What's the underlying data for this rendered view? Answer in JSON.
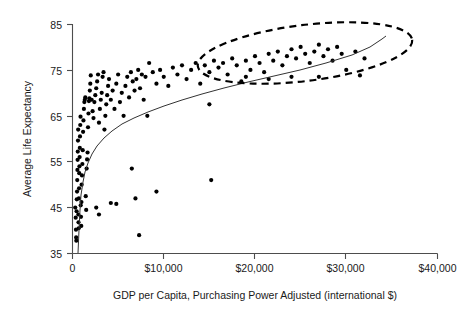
{
  "chart_data": {
    "type": "scatter",
    "title": "",
    "xlabel": "GDP per Capita, Purchasing Power Adjusted (international $)",
    "ylabel": "Average Life Expectancy",
    "xlim": [
      0,
      40000
    ],
    "ylim": [
      35,
      85
    ],
    "grid": false,
    "legend": null,
    "xticks": [
      0,
      10000,
      20000,
      30000,
      40000
    ],
    "xticklabels": [
      "0",
      "$10,000",
      "$20,000",
      "$30,000",
      "$40,000"
    ],
    "yticks": [
      35,
      45,
      55,
      65,
      75,
      85
    ],
    "yticklabels": [
      "35",
      "45",
      "55",
      "65",
      "75",
      "85"
    ],
    "series": [
      {
        "name": "Countries",
        "marker": "filled-circle",
        "color": "#000000",
        "points": [
          [
            300,
            45.0
          ],
          [
            350,
            42.8
          ],
          [
            380,
            40.2
          ],
          [
            400,
            38.5
          ],
          [
            420,
            37.8
          ],
          [
            450,
            44.2
          ],
          [
            470,
            46.8
          ],
          [
            500,
            48.5
          ],
          [
            520,
            51.0
          ],
          [
            540,
            53.2
          ],
          [
            560,
            55.4
          ],
          [
            580,
            57.2
          ],
          [
            600,
            59.6
          ],
          [
            620,
            62.0
          ],
          [
            640,
            43.5
          ],
          [
            660,
            41.8
          ],
          [
            680,
            40.5
          ],
          [
            700,
            47.0
          ],
          [
            720,
            49.2
          ],
          [
            740,
            52.5
          ],
          [
            760,
            54.0
          ],
          [
            780,
            56.0
          ],
          [
            800,
            58.0
          ],
          [
            820,
            60.5
          ],
          [
            850,
            63.0
          ],
          [
            880,
            64.8
          ],
          [
            900,
            45.5
          ],
          [
            930,
            43.0
          ],
          [
            960,
            41.0
          ],
          [
            980,
            46.2
          ],
          [
            1000,
            50.0
          ],
          [
            1040,
            52.0
          ],
          [
            1080,
            54.5
          ],
          [
            1120,
            57.5
          ],
          [
            1160,
            61.5
          ],
          [
            1200,
            64.0
          ],
          [
            1250,
            66.5
          ],
          [
            1300,
            68.0
          ],
          [
            1350,
            68.5
          ],
          [
            1400,
            69.0
          ],
          [
            1450,
            47.5
          ],
          [
            1500,
            44.5
          ],
          [
            1550,
            53.5
          ],
          [
            1600,
            55.5
          ],
          [
            1650,
            57.0
          ],
          [
            1700,
            62.5
          ],
          [
            1750,
            65.5
          ],
          [
            1800,
            68.2
          ],
          [
            1850,
            68.8
          ],
          [
            1900,
            70.5
          ],
          [
            1950,
            72.0
          ],
          [
            2000,
            73.8
          ],
          [
            2100,
            68.5
          ],
          [
            2200,
            66.0
          ],
          [
            2300,
            64.5
          ],
          [
            2400,
            68.0
          ],
          [
            2500,
            69.5
          ],
          [
            2600,
            71.0
          ],
          [
            2700,
            72.5
          ],
          [
            2800,
            74.0
          ],
          [
            2900,
            63.5
          ],
          [
            3000,
            66.5
          ],
          [
            3100,
            68.5
          ],
          [
            3200,
            70.0
          ],
          [
            3300,
            73.5
          ],
          [
            3400,
            74.5
          ],
          [
            3500,
            62.0
          ],
          [
            3600,
            65.0
          ],
          [
            3700,
            67.5
          ],
          [
            3800,
            69.5
          ],
          [
            3900,
            71.5
          ],
          [
            4000,
            73.0
          ],
          [
            4200,
            68.5
          ],
          [
            4400,
            70.5
          ],
          [
            4600,
            66.5
          ],
          [
            4800,
            72.0
          ],
          [
            5000,
            74.0
          ],
          [
            5200,
            68.0
          ],
          [
            5400,
            70.0
          ],
          [
            5600,
            65.0
          ],
          [
            5800,
            71.5
          ],
          [
            6000,
            73.5
          ],
          [
            6200,
            69.0
          ],
          [
            6400,
            74.5
          ],
          [
            6600,
            72.5
          ],
          [
            6800,
            70.5
          ],
          [
            7000,
            73.0
          ],
          [
            7200,
            75.0
          ],
          [
            7400,
            71.0
          ],
          [
            7600,
            74.0
          ],
          [
            7800,
            68.5
          ],
          [
            8000,
            73.5
          ],
          [
            8400,
            76.5
          ],
          [
            8800,
            74.5
          ],
          [
            9200,
            72.0
          ],
          [
            9600,
            75.0
          ],
          [
            10000,
            73.5
          ],
          [
            10500,
            71.5
          ],
          [
            11000,
            75.5
          ],
          [
            11500,
            74.0
          ],
          [
            12000,
            76.0
          ],
          [
            12500,
            73.0
          ],
          [
            13000,
            75.0
          ],
          [
            13500,
            76.5
          ],
          [
            14000,
            72.0
          ],
          [
            14500,
            76.0
          ],
          [
            15000,
            74.5
          ],
          [
            15500,
            77.0
          ],
          [
            16000,
            75.5
          ],
          [
            16500,
            76.5
          ],
          [
            17000,
            74.0
          ],
          [
            17500,
            77.5
          ],
          [
            18000,
            76.0
          ],
          [
            18500,
            72.5
          ],
          [
            19000,
            77.0
          ],
          [
            19500,
            75.0
          ],
          [
            20000,
            78.0
          ],
          [
            20500,
            76.5
          ],
          [
            21000,
            74.5
          ],
          [
            21500,
            78.5
          ],
          [
            22000,
            77.0
          ],
          [
            22500,
            79.0
          ],
          [
            23000,
            76.0
          ],
          [
            23500,
            78.0
          ],
          [
            24000,
            79.5
          ],
          [
            24500,
            77.5
          ],
          [
            25000,
            80.0
          ],
          [
            25500,
            78.5
          ],
          [
            26000,
            76.5
          ],
          [
            26500,
            79.0
          ],
          [
            27000,
            80.5
          ],
          [
            27500,
            78.0
          ],
          [
            28000,
            79.5
          ],
          [
            28500,
            77.0
          ],
          [
            29000,
            80.0
          ],
          [
            29500,
            78.5
          ],
          [
            30000,
            75.0
          ],
          [
            31000,
            79.0
          ],
          [
            32000,
            77.5
          ],
          [
            4800,
            45.8
          ],
          [
            6500,
            53.5
          ],
          [
            6900,
            47.0
          ],
          [
            7300,
            39.0
          ],
          [
            9200,
            48.5
          ],
          [
            15200,
            51.0
          ],
          [
            15000,
            67.5
          ],
          [
            4200,
            46.0
          ],
          [
            8200,
            65.0
          ],
          [
            2600,
            45.0
          ],
          [
            2900,
            43.5
          ],
          [
            24000,
            73.5
          ],
          [
            27000,
            73.5
          ],
          [
            21500,
            73.0
          ],
          [
            19000,
            73.5
          ],
          [
            31500,
            73.8
          ]
        ]
      }
    ],
    "fit_curve": {
      "name": "logarithmic fit",
      "description": "smooth increasing log-shaped trend line",
      "points_px": [
        [
          78,
          253
        ],
        [
          79,
          230
        ],
        [
          80,
          210
        ],
        [
          81,
          195
        ],
        [
          83,
          182
        ],
        [
          85,
          172
        ],
        [
          88,
          163
        ],
        [
          92,
          154
        ],
        [
          97,
          146
        ],
        [
          104,
          138
        ],
        [
          112,
          131
        ],
        [
          122,
          124
        ],
        [
          134,
          118
        ],
        [
          148,
          112
        ],
        [
          164,
          106
        ],
        [
          182,
          100
        ],
        [
          202,
          94
        ],
        [
          224,
          88
        ],
        [
          248,
          82
        ],
        [
          274,
          76
        ],
        [
          300,
          70
        ],
        [
          326,
          63
        ],
        [
          352,
          55
        ],
        [
          370,
          47
        ],
        [
          382,
          39
        ],
        [
          386,
          36
        ]
      ]
    },
    "annotations": [
      {
        "type": "ellipse",
        "style": "dashed",
        "name": "high-income-cluster-ellipse",
        "cx_px": 305,
        "cy_px": 53,
        "rx_px": 108,
        "ry_px": 28,
        "rotation_deg": -7
      }
    ]
  }
}
